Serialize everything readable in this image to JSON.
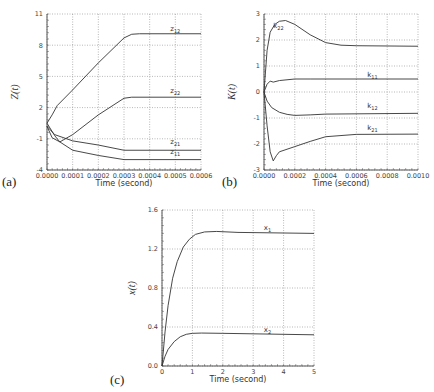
{
  "chart_data": [
    {
      "id": "a",
      "type": "line",
      "panel_label": "(a)",
      "title": "",
      "xlabel": "Time  (second)",
      "ylabel": "Z(t)",
      "xlim": [
        0,
        0.0006
      ],
      "ylim": [
        -4,
        11
      ],
      "xticks": [
        0,
        0.0001,
        0.0002,
        0.0003,
        0.0004,
        0.0005,
        0.0006
      ],
      "xtick_labels": [
        "0.0000",
        "0.0001",
        "0.0002",
        "0.0003",
        "0.0004",
        "0.0005",
        "0.0006"
      ],
      "yticks": [
        -4,
        -1,
        2,
        5,
        8,
        11
      ],
      "ytick_labels": [
        "-4",
        "-1",
        "2",
        "5",
        "8",
        "11"
      ],
      "grid": true,
      "box": {
        "x0": 47,
        "y0": 14,
        "x1": 201,
        "y1": 170
      },
      "series": [
        {
          "name": "z12",
          "label_main": "z",
          "label_sub": "12",
          "label_at": [
            0.00048,
            9.4
          ],
          "x": [
            0,
            2e-05,
            4e-05,
            0.0001,
            0.0002,
            0.0003,
            0.00033,
            0.00036,
            0.0006
          ],
          "y": [
            0.5,
            1.3,
            2.2,
            3.7,
            6.3,
            8.7,
            9.05,
            9.1,
            9.1
          ]
        },
        {
          "name": "z22",
          "label_main": "z",
          "label_sub": "22",
          "label_at": [
            0.00048,
            3.4
          ],
          "x": [
            0,
            3e-05,
            5e-05,
            0.0001,
            0.0002,
            0.0003,
            0.00033,
            0.0006
          ],
          "y": [
            0.5,
            -0.7,
            -1.3,
            -0.6,
            1.3,
            2.9,
            3.0,
            3.0
          ],
          "note": "starts near 0.5, dips to about -1.3 around 0.00005 then rises to ~3"
        },
        {
          "name": "z21",
          "label_main": "z",
          "label_sub": "21",
          "label_at": [
            0.00048,
            -1.5
          ],
          "x": [
            0,
            3e-05,
            0.0001,
            0.0002,
            0.0003,
            0.0006
          ],
          "y": [
            0.2,
            -0.6,
            -1.2,
            -1.6,
            -2.1,
            -2.1
          ]
        },
        {
          "name": "z11",
          "label_main": "z",
          "label_sub": "11",
          "label_at": [
            0.00048,
            -2.5
          ],
          "x": [
            0,
            2e-05,
            5e-05,
            0.0001,
            0.0002,
            0.0003,
            0.0006
          ],
          "y": [
            0.2,
            -0.9,
            -1.3,
            -2.1,
            -2.6,
            -3.0,
            -3.0
          ]
        }
      ]
    },
    {
      "id": "b",
      "type": "line",
      "panel_label": "(b)",
      "title": "",
      "xlabel": "Time  (second)",
      "ylabel": "K(t)",
      "xlim": [
        0,
        0.001
      ],
      "ylim": [
        -3,
        3
      ],
      "xticks": [
        0,
        0.0002,
        0.0004,
        0.0006,
        0.0008,
        0.001
      ],
      "xtick_labels": [
        "0.0000",
        "0.0002",
        "0.0004",
        "0.0006",
        "0.0008",
        "0.0010"
      ],
      "yticks": [
        -3,
        -2,
        -1,
        0,
        1,
        2,
        3
      ],
      "ytick_labels": [
        "-3",
        "-2",
        "-1",
        "0",
        "1",
        "2",
        "3"
      ],
      "grid": true,
      "box": {
        "x0": 264,
        "y0": 14,
        "x1": 418,
        "y1": 170
      },
      "series": [
        {
          "name": "k22",
          "label_main": "k",
          "label_sub": "22",
          "label_at": [
            6e-05,
            2.45
          ],
          "x": [
            0,
            1e-05,
            2e-05,
            4e-05,
            7e-05,
            0.0001,
            0.00014,
            0.0002,
            0.0003,
            0.0004,
            0.0005,
            0.0006,
            0.001
          ],
          "y": [
            0,
            0.8,
            1.6,
            2.3,
            2.6,
            2.72,
            2.75,
            2.6,
            2.2,
            1.9,
            1.8,
            1.78,
            1.76
          ]
        },
        {
          "name": "k11",
          "label_main": "k",
          "label_sub": "11",
          "label_at": [
            0.00067,
            0.57
          ],
          "x": [
            0,
            2e-05,
            4e-05,
            6e-05,
            0.0001,
            0.0002,
            0.0003,
            0.001
          ],
          "y": [
            0,
            0.3,
            0.42,
            0.38,
            0.44,
            0.5,
            0.5,
            0.5
          ]
        },
        {
          "name": "k12",
          "label_main": "k",
          "label_sub": "12",
          "label_at": [
            0.00067,
            -0.6
          ],
          "x": [
            0,
            2e-05,
            5e-05,
            0.0001,
            0.00015,
            0.0002,
            0.0003,
            0.0004,
            0.001
          ],
          "y": [
            0,
            -0.35,
            -0.6,
            -0.78,
            -0.86,
            -0.9,
            -0.88,
            -0.85,
            -0.82
          ]
        },
        {
          "name": "k21",
          "label_main": "k",
          "label_sub": "21",
          "label_at": [
            0.00067,
            -1.45
          ],
          "x": [
            0,
            2e-05,
            4e-05,
            6e-05,
            8e-05,
            0.0001,
            0.0002,
            0.0003,
            0.0004,
            0.0006,
            0.001
          ],
          "y": [
            0,
            -1.3,
            -2.3,
            -2.65,
            -2.45,
            -2.3,
            -2.1,
            -1.9,
            -1.72,
            -1.63,
            -1.62
          ]
        }
      ]
    },
    {
      "id": "c",
      "type": "line",
      "panel_label": "(c)",
      "title": "",
      "xlabel": "Time  (second)",
      "ylabel": "x(t)",
      "xlim": [
        0,
        5
      ],
      "ylim": [
        0,
        1.6
      ],
      "xticks": [
        0,
        1,
        2,
        3,
        4,
        5
      ],
      "xtick_labels": [
        "0",
        "1",
        "2",
        "3",
        "4",
        "5"
      ],
      "yticks": [
        0,
        0.4,
        0.8,
        1.2,
        1.6
      ],
      "ytick_labels": [
        "0.0",
        "0.4",
        "0.8",
        "1.2",
        "1.6"
      ],
      "grid": true,
      "box": {
        "x0": 162,
        "y0": 210,
        "x1": 314,
        "y1": 366
      },
      "series": [
        {
          "name": "x1",
          "label_main": "x",
          "label_sub": "1",
          "label_at": [
            3.35,
            1.4
          ],
          "x": [
            0,
            0.1,
            0.2,
            0.35,
            0.5,
            0.7,
            0.9,
            1.1,
            1.4,
            1.8,
            2.5,
            5
          ],
          "y": [
            0,
            0.35,
            0.62,
            0.9,
            1.07,
            1.22,
            1.3,
            1.35,
            1.375,
            1.38,
            1.37,
            1.36
          ]
        },
        {
          "name": "x2",
          "label_main": "x",
          "label_sub": "2",
          "label_at": [
            3.35,
            0.35
          ],
          "x": [
            0,
            0.1,
            0.2,
            0.4,
            0.6,
            0.8,
            1.0,
            1.3,
            2,
            5
          ],
          "y": [
            0,
            0.1,
            0.17,
            0.25,
            0.3,
            0.325,
            0.335,
            0.338,
            0.335,
            0.32
          ]
        }
      ]
    }
  ]
}
